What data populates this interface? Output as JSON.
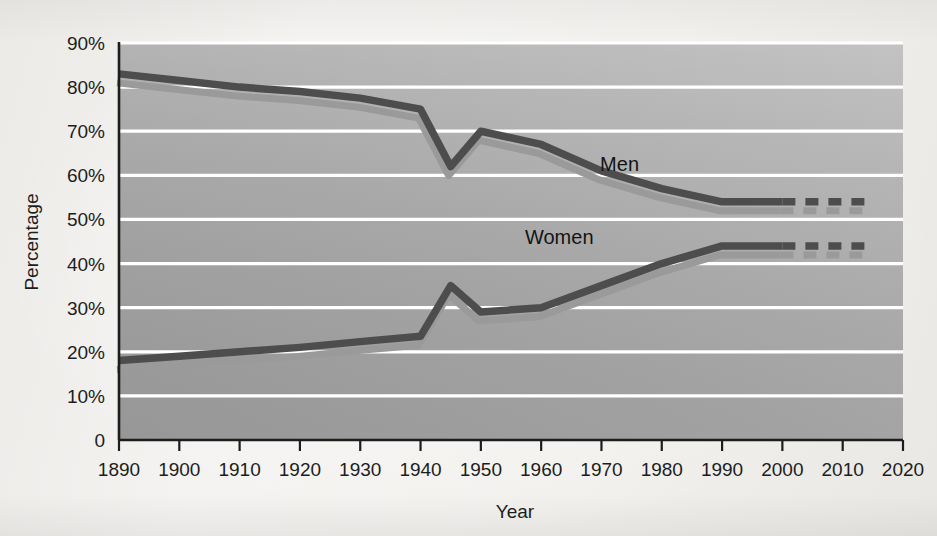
{
  "figure": {
    "background_color": "#f1f0ed",
    "plot_background_color": "#a9a9a9",
    "gridline_color": "#ffffff",
    "axis_color": "#1d1d1d"
  },
  "chart_data": {
    "type": "line",
    "title": "",
    "xlabel": "Year",
    "ylabel": "Percentage",
    "xlim": [
      1890,
      2020
    ],
    "ylim": [
      0,
      90
    ],
    "grid": true,
    "legend_position": "inline-labels",
    "xtick_labels": [
      "1890",
      "1900",
      "1910",
      "1920",
      "1930",
      "1940",
      "1950",
      "1960",
      "1970",
      "1980",
      "1990",
      "2000",
      "2010",
      "2020"
    ],
    "xticks": [
      1890,
      1900,
      1910,
      1920,
      1930,
      1940,
      1950,
      1960,
      1970,
      1980,
      1990,
      2000,
      2010,
      2020
    ],
    "ytick_labels": [
      "0",
      "10%",
      "20%",
      "30%",
      "40%",
      "50%",
      "60%",
      "70%",
      "80%",
      "90%"
    ],
    "yticks": [
      0,
      10,
      20,
      30,
      40,
      50,
      60,
      70,
      80,
      90
    ],
    "series": [
      {
        "name": "Men",
        "color": "#4d4d4d",
        "shadow_color": "#9a9a9a",
        "label_x": 1973,
        "label_y": 61,
        "solid": {
          "x": [
            1890,
            1900,
            1910,
            1920,
            1930,
            1940,
            1945,
            1950,
            1960,
            1970,
            1980,
            1990,
            2000
          ],
          "y": [
            83,
            81.5,
            80,
            79,
            77.5,
            75,
            62,
            70,
            67,
            61,
            57,
            54,
            54
          ]
        },
        "dashed": {
          "x": [
            2000,
            2015
          ],
          "y": [
            54,
            54
          ]
        }
      },
      {
        "name": "Women",
        "color": "#4d4d4d",
        "shadow_color": "#9a9a9a",
        "label_x": 1963,
        "label_y": 44.5,
        "solid": {
          "x": [
            1890,
            1900,
            1910,
            1920,
            1930,
            1940,
            1945,
            1950,
            1960,
            1970,
            1980,
            1990,
            2000
          ],
          "y": [
            18,
            19,
            20,
            21,
            22.3,
            23.5,
            35,
            29,
            30,
            35,
            40,
            44,
            44
          ]
        },
        "dashed": {
          "x": [
            2000,
            2015
          ],
          "y": [
            44,
            44
          ]
        }
      }
    ],
    "annotations": [
      {
        "text": "Men",
        "x": 1973,
        "y": 61
      },
      {
        "text": "Women",
        "x": 1963,
        "y": 44.5
      }
    ]
  }
}
